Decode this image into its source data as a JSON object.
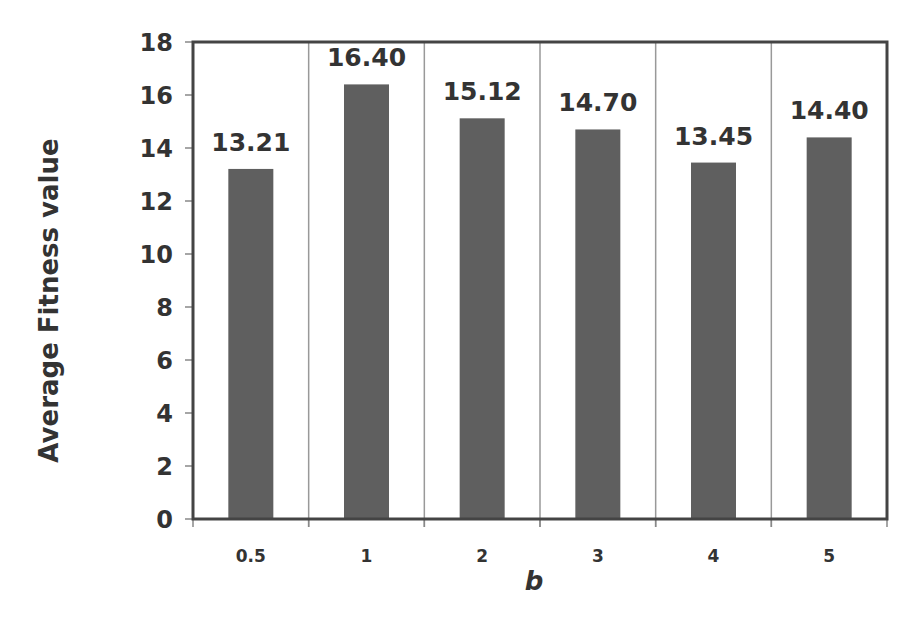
{
  "chart_data": {
    "type": "bar",
    "title": "",
    "xlabel": "b",
    "ylabel": "Average Fitness value",
    "categories": [
      "0.5",
      "1",
      "2",
      "3",
      "4",
      "5"
    ],
    "values": [
      13.21,
      16.4,
      15.12,
      14.7,
      13.45,
      14.4
    ],
    "data_labels": [
      "13.21",
      "16.40",
      "15.12",
      "14.70",
      "13.45",
      "14.40"
    ],
    "ylim": [
      0,
      18
    ],
    "yticks": [
      0,
      2,
      4,
      6,
      8,
      10,
      12,
      14,
      16,
      18
    ],
    "grid": "vertical category separators",
    "legend": "none",
    "bar_color": "#5f5f5f"
  }
}
